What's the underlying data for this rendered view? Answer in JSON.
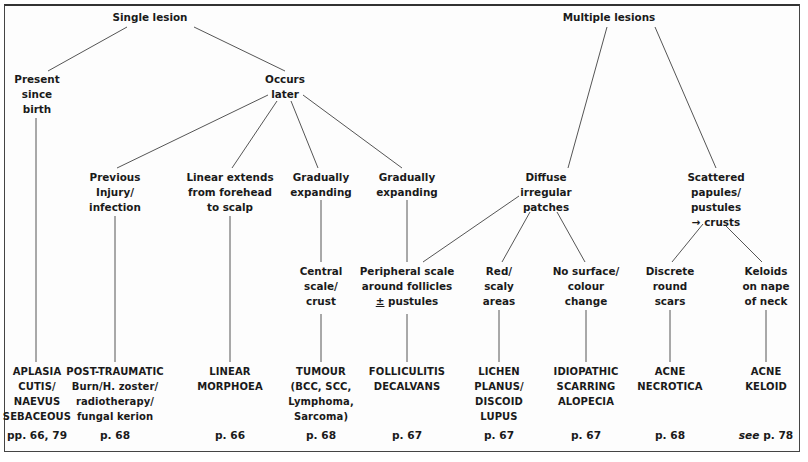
{
  "diagram": {
    "type": "flowchart-tree",
    "roots": [
      {
        "id": "single",
        "lines": [
          "Single lesion"
        ],
        "x": 150,
        "y": 17
      },
      {
        "id": "multiple",
        "lines": [
          "Multiple lesions"
        ],
        "x": 609,
        "y": 17
      }
    ],
    "level2": [
      {
        "id": "since_birth",
        "lines": [
          "Present",
          "since",
          "birth"
        ],
        "x": 37,
        "y": 73
      },
      {
        "id": "occurs_later",
        "lines": [
          "Occurs",
          "later"
        ],
        "x": 285,
        "y": 73
      },
      {
        "id": "diffuse",
        "lines": [
          "Diffuse",
          "irregular",
          "patches"
        ],
        "x": 547,
        "y": 172
      },
      {
        "id": "scattered",
        "lines": [
          "Scattered",
          "papules/",
          "pustules",
          "→ crusts"
        ],
        "x": 716,
        "y": 172
      }
    ],
    "level3": [
      {
        "id": "previous_injury",
        "lines": [
          "Previous",
          "Injury/",
          "infection"
        ],
        "x": 115,
        "y": 172
      },
      {
        "id": "linear_extends",
        "lines": [
          "Linear extends",
          "from forehead",
          "to scalp"
        ],
        "x": 230,
        "y": 172
      },
      {
        "id": "grad_exp_1",
        "lines": [
          "Gradually",
          "expanding"
        ],
        "x": 321,
        "y": 172
      },
      {
        "id": "grad_exp_2",
        "lines": [
          "Gradually",
          "expanding"
        ],
        "x": 407,
        "y": 172
      }
    ],
    "level4": [
      {
        "id": "central_scale",
        "lines": [
          "Central",
          "scale/",
          "crust"
        ],
        "x": 321,
        "y": 266
      },
      {
        "id": "peripheral_scale",
        "lines": [
          "Peripheral scale",
          "around follicles",
          "± pustules"
        ],
        "x": 407,
        "y": 266
      },
      {
        "id": "red_scaly",
        "lines": [
          "Red/",
          "scaly",
          "areas"
        ],
        "x": 499,
        "y": 266
      },
      {
        "id": "no_surface",
        "lines": [
          "No surface/",
          "colour",
          "change"
        ],
        "x": 586,
        "y": 266
      },
      {
        "id": "discrete_round",
        "lines": [
          "Discrete",
          "round",
          "scars"
        ],
        "x": 670,
        "y": 266
      },
      {
        "id": "keloids_nape",
        "lines": [
          "Keloids",
          "on nape",
          "of neck"
        ],
        "x": 766,
        "y": 266
      }
    ],
    "diagnoses": [
      {
        "id": "aplasia",
        "lines": [
          "APLASIA",
          "CUTIS/",
          "NAEVUS",
          "SEBACEOUS"
        ],
        "x": 37,
        "y": 364,
        "page": "pp. 66, 79"
      },
      {
        "id": "post_traumatic",
        "lines": [
          "POST-TRAUMATIC",
          "Burn/H. zoster/",
          "radiotherapy/",
          "fungal kerion"
        ],
        "x": 115,
        "y": 364,
        "page": "p. 68"
      },
      {
        "id": "linear_morphoea",
        "lines": [
          "LINEAR",
          "MORPHOEA"
        ],
        "x": 230,
        "y": 364,
        "page": "p. 66"
      },
      {
        "id": "tumour",
        "lines": [
          "TUMOUR",
          "(BCC, SCC,",
          "Lymphoma,",
          "Sarcoma)"
        ],
        "x": 321,
        "y": 364,
        "page": "p. 68"
      },
      {
        "id": "folliculitis",
        "lines": [
          "FOLLICULITIS",
          "DECALVANS"
        ],
        "x": 407,
        "y": 364,
        "page": "p. 67"
      },
      {
        "id": "lichen",
        "lines": [
          "LICHEN",
          "PLANUS/",
          "DISCOID",
          "LUPUS"
        ],
        "x": 499,
        "y": 364,
        "page": "p. 67"
      },
      {
        "id": "idiopathic",
        "lines": [
          "IDIOPATHIC",
          "SCARRING",
          "ALOPECIA"
        ],
        "x": 586,
        "y": 364,
        "page": "p. 67"
      },
      {
        "id": "acne_necrotica",
        "lines": [
          "ACNE",
          "NECROTICA"
        ],
        "x": 670,
        "y": 364,
        "page": "p. 68"
      },
      {
        "id": "acne_keloid",
        "lines": [
          "ACNE",
          "KELOID"
        ],
        "x": 766,
        "y": 364,
        "page_prefix": "see",
        "page": "p. 78"
      }
    ],
    "edges": [
      {
        "from": "single",
        "to": "since_birth",
        "x1": 127,
        "y1": 27,
        "x2": 48,
        "y2": 71
      },
      {
        "from": "single",
        "to": "occurs_later",
        "x1": 194,
        "y1": 27,
        "x2": 285,
        "y2": 71
      },
      {
        "from": "since_birth",
        "to": "aplasia",
        "x1": 36,
        "y1": 118,
        "x2": 36,
        "y2": 362
      },
      {
        "from": "occurs_later",
        "to": "previous_injury",
        "x1": 268,
        "y1": 95,
        "x2": 117,
        "y2": 168
      },
      {
        "from": "occurs_later",
        "to": "linear_extends",
        "x1": 277,
        "y1": 101,
        "x2": 232,
        "y2": 168
      },
      {
        "from": "occurs_later",
        "to": "grad_exp_1",
        "x1": 291,
        "y1": 101,
        "x2": 318,
        "y2": 168
      },
      {
        "from": "occurs_later",
        "to": "grad_exp_2",
        "x1": 303,
        "y1": 95,
        "x2": 402,
        "y2": 168
      },
      {
        "from": "previous_injury",
        "to": "post_traumatic",
        "x1": 115,
        "y1": 216,
        "x2": 115,
        "y2": 362
      },
      {
        "from": "linear_extends",
        "to": "linear_morphoea",
        "x1": 230,
        "y1": 216,
        "x2": 230,
        "y2": 362
      },
      {
        "from": "grad_exp_1",
        "to": "central_scale",
        "x1": 321,
        "y1": 200,
        "x2": 321,
        "y2": 262
      },
      {
        "from": "grad_exp_2",
        "to": "peripheral_scale",
        "x1": 407,
        "y1": 200,
        "x2": 407,
        "y2": 262
      },
      {
        "from": "central_scale",
        "to": "tumour",
        "x1": 321,
        "y1": 314,
        "x2": 321,
        "y2": 362
      },
      {
        "from": "peripheral_scale",
        "to": "folliculitis",
        "x1": 407,
        "y1": 314,
        "x2": 407,
        "y2": 362
      },
      {
        "from": "multiple",
        "to": "diffuse",
        "x1": 607,
        "y1": 27,
        "x2": 568,
        "y2": 168
      },
      {
        "from": "multiple",
        "to": "scattered",
        "x1": 655,
        "y1": 27,
        "x2": 716,
        "y2": 168
      },
      {
        "from": "diffuse",
        "to": "peripheral_scale",
        "x1": 519,
        "y1": 196,
        "x2": 423,
        "y2": 262
      },
      {
        "from": "diffuse",
        "to": "red_scaly",
        "x1": 530,
        "y1": 212,
        "x2": 502,
        "y2": 262
      },
      {
        "from": "diffuse",
        "to": "no_surface",
        "x1": 557,
        "y1": 212,
        "x2": 585,
        "y2": 262
      },
      {
        "from": "scattered",
        "to": "discrete_round",
        "x1": 703,
        "y1": 224,
        "x2": 672,
        "y2": 262
      },
      {
        "from": "scattered",
        "to": "keloids_nape",
        "x1": 726,
        "y1": 226,
        "x2": 762,
        "y2": 262
      },
      {
        "from": "red_scaly",
        "to": "lichen",
        "x1": 499,
        "y1": 310,
        "x2": 499,
        "y2": 362
      },
      {
        "from": "no_surface",
        "to": "idiopathic",
        "x1": 586,
        "y1": 310,
        "x2": 586,
        "y2": 362
      },
      {
        "from": "discrete_round",
        "to": "acne_necrotica",
        "x1": 670,
        "y1": 310,
        "x2": 670,
        "y2": 362
      },
      {
        "from": "keloids_nape",
        "to": "acne_keloid",
        "x1": 766,
        "y1": 310,
        "x2": 766,
        "y2": 362
      }
    ]
  },
  "text": {
    "single": {
      "l0": "Single lesion"
    },
    "multiple": {
      "l0": "Multiple lesions"
    },
    "since_birth": {
      "l0": "Present",
      "l1": "since",
      "l2": "birth"
    },
    "occurs_later": {
      "l0": "Occurs",
      "l1": "later"
    },
    "previous_injury": {
      "l0": "Previous",
      "l1": "Injury/",
      "l2": "infection"
    },
    "linear_extends": {
      "l0": "Linear extends",
      "l1": "from forehead",
      "l2": "to scalp"
    },
    "grad_exp_1": {
      "l0": "Gradually",
      "l1": "expanding"
    },
    "grad_exp_2": {
      "l0": "Gradually",
      "l1": "expanding"
    },
    "diffuse": {
      "l0": "Diffuse",
      "l1": "irregular",
      "l2": "patches"
    },
    "scattered": {
      "l0": "Scattered",
      "l1": "papules/",
      "l2": "pustules",
      "l3": "→ crusts"
    },
    "central_scale": {
      "l0": "Central",
      "l1": "scale/",
      "l2": "crust"
    },
    "peripheral_scale": {
      "l0": "Peripheral scale",
      "l1": "around follicles",
      "l2_sym": "±",
      "l2": " pustules"
    },
    "red_scaly": {
      "l0": "Red/",
      "l1": "scaly",
      "l2": "areas"
    },
    "no_surface": {
      "l0": "No surface/",
      "l1": "colour",
      "l2": "change"
    },
    "discrete_round": {
      "l0": "Discrete",
      "l1": "round",
      "l2": "scars"
    },
    "keloids_nape": {
      "l0": "Keloids",
      "l1": "on nape",
      "l2": "of neck"
    },
    "aplasia": {
      "l0": "APLASIA",
      "l1": "CUTIS/",
      "l2": "NAEVUS",
      "l3": "SEBACEOUS",
      "page": "pp. 66, 79"
    },
    "post_traumatic": {
      "l0": "POST-TRAUMATIC",
      "l1": "Burn/H. zoster/",
      "l2": "radiotherapy/",
      "l3": "fungal kerion",
      "page": "p. 68"
    },
    "linear_morphoea": {
      "l0": "LINEAR",
      "l1": "MORPHOEA",
      "page": "p. 66"
    },
    "tumour": {
      "l0": "TUMOUR",
      "l1": "(BCC, SCC,",
      "l2": "Lymphoma,",
      "l3": "Sarcoma)",
      "page": "p. 68"
    },
    "folliculitis": {
      "l0": "FOLLICULITIS",
      "l1": "DECALVANS",
      "page": "p. 67"
    },
    "lichen": {
      "l0": "LICHEN",
      "l1": "PLANUS/",
      "l2": "DISCOID",
      "l3": "LUPUS",
      "page": "p. 67"
    },
    "idiopathic": {
      "l0": "IDIOPATHIC",
      "l1": "SCARRING",
      "l2": "ALOPECIA",
      "page": "p. 67"
    },
    "acne_necrotica": {
      "l0": "ACNE",
      "l1": "NECROTICA",
      "page": "p. 68"
    },
    "acne_keloid": {
      "l0": "ACNE",
      "l1": "KELOID",
      "page_prefix": "see",
      "page": " p. 78"
    }
  }
}
